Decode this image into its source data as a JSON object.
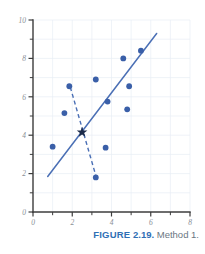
{
  "figure": {
    "caption_label": "FIGURE",
    "caption_number": "2.19.",
    "caption_text": "Method 1.",
    "accent_color": "#2f6fb5",
    "point_color": "#3a5fa8",
    "line_color": "#4a6fb5",
    "axis_color": "#3c3c3c",
    "grid_color": "#e8eef5",
    "tick_label_color": "#8a8f96"
  },
  "chart_data": {
    "type": "scatter",
    "title": "",
    "xlabel": "",
    "ylabel": "",
    "xlim": [
      0,
      8
    ],
    "ylim": [
      0,
      10
    ],
    "xticks": [
      0,
      2,
      4,
      6,
      8
    ],
    "yticks": [
      0,
      2,
      4,
      6,
      8,
      10
    ],
    "xtick_labels": [
      "0",
      "2",
      "4",
      "6",
      "8"
    ],
    "ytick_labels": [
      "0",
      "2",
      "4",
      "6",
      "8",
      "10"
    ],
    "x_minor_ticks": [
      1,
      3,
      5,
      7
    ],
    "y_minor_ticks": [
      1,
      3,
      5,
      7,
      9
    ],
    "grid": true,
    "legend": "none",
    "points": [
      {
        "x": 1.0,
        "y": 3.4
      },
      {
        "x": 1.6,
        "y": 5.15
      },
      {
        "x": 1.85,
        "y": 6.55
      },
      {
        "x": 3.2,
        "y": 6.9
      },
      {
        "x": 3.2,
        "y": 1.8
      },
      {
        "x": 3.7,
        "y": 3.35
      },
      {
        "x": 3.8,
        "y": 5.75
      },
      {
        "x": 4.6,
        "y": 8.0
      },
      {
        "x": 4.8,
        "y": 5.35
      },
      {
        "x": 4.9,
        "y": 6.55
      },
      {
        "x": 5.5,
        "y": 8.4
      }
    ],
    "centroid": {
      "x": 2.5,
      "y": 4.15,
      "marker": "star"
    },
    "solid_line": {
      "x1": 0.75,
      "y1": 1.85,
      "x2": 6.3,
      "y2": 9.3,
      "style": "solid"
    },
    "dashed_line": {
      "x1": 1.9,
      "y1": 6.5,
      "x2": 3.2,
      "y2": 1.9,
      "style": "dashed"
    }
  }
}
